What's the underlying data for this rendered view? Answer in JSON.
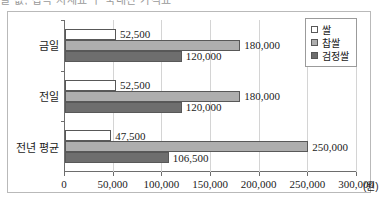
{
  "clipped_header_text": "쌀 값, 잡곡 시세표 ㅣ 국내산 가격표",
  "chart_data": {
    "type": "bar",
    "orientation": "horizontal",
    "title": "",
    "xlabel": "",
    "ylabel": "",
    "unit_label": "(원)",
    "categories": [
      "금일",
      "전일",
      "전년 평균"
    ],
    "series": [
      {
        "name": "쌀",
        "color": "#ffffff",
        "values": [
          52500,
          52500,
          47500
        ]
      },
      {
        "name": "찹쌀",
        "color": "#aeaeae",
        "values": [
          180000,
          180000,
          250000
        ]
      },
      {
        "name": "검정쌀",
        "color": "#6e6e6e",
        "values": [
          120000,
          120000,
          106500
        ]
      }
    ],
    "data_labels": [
      [
        "52,500",
        "180,000",
        "120,000"
      ],
      [
        "52,500",
        "180,000",
        "120,000"
      ],
      [
        "47,500",
        "250,000",
        "106,500"
      ]
    ],
    "xlim": [
      0,
      300000
    ],
    "xticks": [
      0,
      50000,
      100000,
      150000,
      200000,
      250000,
      300000
    ],
    "xtick_labels": [
      "0",
      "50,000",
      "100,000",
      "150,000",
      "200,000",
      "250,000",
      "300,000"
    ],
    "grid": true,
    "legend_position": "top-right",
    "legend_entries": [
      "쌀",
      "찹쌀",
      "검정쌀"
    ]
  }
}
